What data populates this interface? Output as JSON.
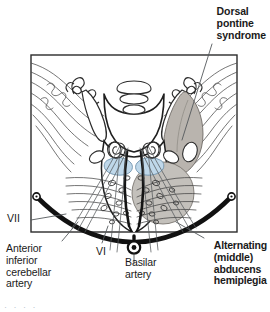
{
  "figure": {
    "kind": "neuroanatomy-cross-section",
    "region": "pons",
    "view": "axial section of pons with cerebellum"
  },
  "annotations": {
    "dorsal_syndrome_title": "Dorsal\npontine\nsyndrome",
    "alternating_label": "Alternating\n(middle)\nabducens\nhemiplegia",
    "aica_label": "Anterior\ninferior\ncerebellar\nartery",
    "nerve_vii": "VII",
    "nerve_vi": "VI",
    "basilar_label": "Basilar\nartery",
    "caption_fragment": "· · · ·"
  },
  "colors": {
    "ink": "#1a1a1a",
    "lesion_gray": "#b9b4ae",
    "lesion_gray_dark": "#a8a29b",
    "ventral_lesion_gray": "#c3c0bb",
    "lemniscus_blue": "#bfd8ea",
    "lemniscus_blue_edge": "#7fa8c4",
    "frame": "#2b2b2b",
    "artery_black": "#111111",
    "paper": "#ffffff",
    "caption_fragment": "#b9c4cf"
  },
  "structures": {
    "shaded_regions": [
      {
        "name": "dorsal-pontine-lesion",
        "side": "right",
        "shade": "gray"
      },
      {
        "name": "ventral-paramedian-lesion",
        "side": "right",
        "shade": "gray"
      },
      {
        "name": "medial-lemniscus-left",
        "side": "left",
        "shade": "blue"
      },
      {
        "name": "medial-lemniscus-right",
        "side": "right",
        "shade": "blue"
      }
    ],
    "vessels": [
      {
        "name": "basilar-artery",
        "position": "ventral-midline"
      },
      {
        "name": "anterior-inferior-cerebellar-artery-left",
        "position": "lateral-left"
      },
      {
        "name": "anterior-inferior-cerebellar-artery-right",
        "position": "lateral-right"
      }
    ],
    "nerves": [
      {
        "name": "abducens-nerve",
        "numeral": "VI"
      },
      {
        "name": "facial-nerve",
        "numeral": "VII"
      }
    ]
  }
}
